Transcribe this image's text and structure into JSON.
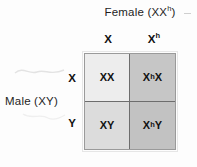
{
  "figure": {
    "type": "punnett-square",
    "title_top": {
      "text": "Female (XX",
      "superscript": "h",
      "suffix": ")"
    },
    "title_left": "Male (XY)",
    "columns": [
      {
        "base": "X",
        "superscript": ""
      },
      {
        "base": "X",
        "superscript": "h"
      }
    ],
    "rows": [
      {
        "base": "X",
        "superscript": ""
      },
      {
        "base": "Y",
        "superscript": ""
      }
    ],
    "cells": [
      [
        {
          "prefix": "",
          "superscript": "",
          "suffix": "XX"
        },
        {
          "prefix": "X",
          "superscript": "h",
          "suffix": "X"
        }
      ],
      [
        {
          "prefix": "",
          "superscript": "",
          "suffix": "XY"
        },
        {
          "prefix": "X",
          "superscript": "h",
          "suffix": "Y"
        }
      ]
    ],
    "colors": {
      "cell_top_left": "#ededed",
      "cell_top_right": "#c6c6c6",
      "cell_bottom_left": "#dcdcdc",
      "cell_bottom_right": "#c2c2c2",
      "grid_border": "#9a9a9a",
      "grid_divider": "#6d6d6d",
      "text": "#111111",
      "background": "#fdfdfd"
    }
  }
}
